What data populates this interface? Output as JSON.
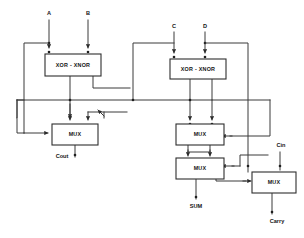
{
  "diagram": {
    "canvas": {
      "width": 304,
      "height": 238,
      "background": "#ffffff"
    },
    "line_color": "#3a3a3a",
    "block_stroke": "#2e2e2e",
    "text_color": "#141414",
    "inputs": [
      {
        "id": "A",
        "label": "A",
        "x": 49,
        "y": 14
      },
      {
        "id": "B",
        "label": "B",
        "x": 88,
        "y": 14
      },
      {
        "id": "C",
        "label": "C",
        "x": 174,
        "y": 27
      },
      {
        "id": "D",
        "label": "D",
        "x": 205,
        "y": 27
      },
      {
        "id": "Cin",
        "label": "Cin",
        "x": 280,
        "y": 146
      }
    ],
    "outputs": [
      {
        "id": "Cout",
        "label": "Cout",
        "x": 62,
        "y": 157
      },
      {
        "id": "SUM",
        "label": "SUM",
        "x": 196,
        "y": 207
      },
      {
        "id": "Carry",
        "label": "Carry",
        "x": 279,
        "y": 222
      }
    ],
    "blocks": [
      {
        "id": "xor-xnor-left",
        "label": "XOR - XNOR",
        "x": 45,
        "y": 54,
        "w": 56,
        "h": 22
      },
      {
        "id": "xor-xnor-right",
        "label": "XOR - XNOR",
        "x": 170,
        "y": 59,
        "w": 56,
        "h": 20
      },
      {
        "id": "mux-cout",
        "label": "MUX",
        "x": 52,
        "y": 124,
        "w": 46,
        "h": 21
      },
      {
        "id": "mux-mid-upper",
        "label": "MUX",
        "x": 176,
        "y": 124,
        "w": 48,
        "h": 21
      },
      {
        "id": "mux-mid-lower",
        "label": "MUX",
        "x": 176,
        "y": 158,
        "w": 48,
        "h": 21
      },
      {
        "id": "mux-carry",
        "label": "MUX",
        "x": 252,
        "y": 172,
        "w": 44,
        "h": 21
      }
    ]
  }
}
